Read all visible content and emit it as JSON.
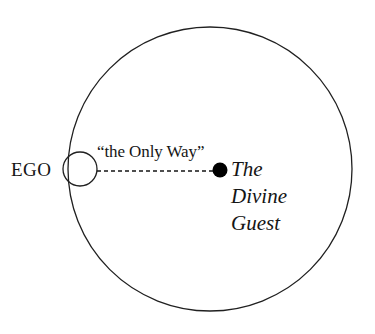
{
  "diagram": {
    "background_color": "#ffffff",
    "stroke_color": "#202020",
    "fill_color": "#000000",
    "outer_circle": {
      "name": "divine-realm-circle",
      "cx": 210,
      "cy": 169,
      "r": 142,
      "stroke_width": 1.3,
      "fill": "none"
    },
    "ego_circle": {
      "name": "ego-circle",
      "cx": 80,
      "cy": 169,
      "r": 17,
      "stroke_width": 1.3,
      "fill": "none"
    },
    "center_dot": {
      "name": "divine-guest-dot",
      "cx": 220,
      "cy": 170,
      "r": 7.5,
      "fill": "#000000"
    },
    "connector": {
      "name": "only-way-dashed-line",
      "x1": 97,
      "y1": 171,
      "x2": 215,
      "y2": 171,
      "dash": "4,3",
      "stroke_width": 1.4
    },
    "labels": {
      "ego": "EGO",
      "only_way": "“the Only Way”",
      "divine_guest_lines": [
        "The",
        "Divine",
        "Guest"
      ]
    }
  }
}
